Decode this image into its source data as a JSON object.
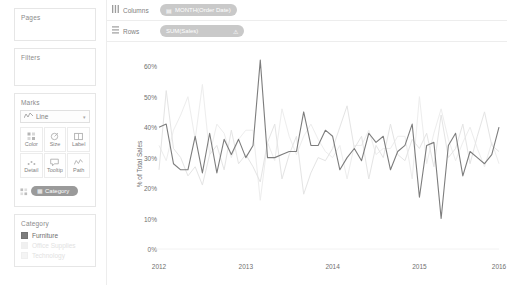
{
  "sidebar": {
    "pages": {
      "title": "Pages"
    },
    "filters": {
      "title": "Filters"
    },
    "marks": {
      "title": "Marks",
      "mark_type": "Line",
      "mark_type_caret": "▾",
      "buttons": [
        {
          "label": "Color",
          "icon": "color-icon"
        },
        {
          "label": "Size",
          "icon": "size-icon"
        },
        {
          "label": "Label",
          "icon": "label-icon"
        },
        {
          "label": "Detail",
          "icon": "detail-icon"
        },
        {
          "label": "Tooltip",
          "icon": "tooltip-icon"
        },
        {
          "label": "Path",
          "icon": "path-icon"
        }
      ],
      "color_shelf_pill": "Category"
    },
    "legend": {
      "title": "Category",
      "items": [
        {
          "label": "Furniture",
          "color": "#7d7d7d",
          "dim": false
        },
        {
          "label": "Office Supplies",
          "color": "#ececec",
          "dim": true
        },
        {
          "label": "Technology",
          "color": "#f0f0f0",
          "dim": true
        }
      ]
    }
  },
  "shelves": {
    "columns": {
      "name": "Columns",
      "pill": "MONTH(Order Date)",
      "pill_icon": "calendar-icon"
    },
    "rows": {
      "name": "Rows",
      "pill": "SUM(Sales)",
      "warning": "⚠"
    }
  },
  "chart_data": {
    "type": "line",
    "title": "",
    "xlabel": "",
    "ylabel": "% of Total Sales",
    "ylim": [
      0,
      65
    ],
    "yticks": [
      0,
      10,
      20,
      30,
      40,
      50,
      60
    ],
    "ytick_labels": [
      "0%",
      "10%",
      "20%",
      "30%",
      "40%",
      "50%",
      "60%"
    ],
    "xtick_labels": [
      "2012",
      "2013",
      "2014",
      "2015",
      "2016"
    ],
    "xtick_positions": [
      0,
      12,
      24,
      36,
      48
    ],
    "grid": false,
    "legend_position": "sidebar",
    "x": [
      0,
      1,
      2,
      3,
      4,
      5,
      6,
      7,
      8,
      9,
      10,
      11,
      12,
      13,
      14,
      15,
      16,
      17,
      18,
      19,
      20,
      21,
      22,
      23,
      24,
      25,
      26,
      27,
      28,
      29,
      30,
      31,
      32,
      33,
      34,
      35,
      36,
      37,
      38,
      39,
      40,
      41,
      42,
      43,
      44,
      45,
      46,
      47
    ],
    "series": [
      {
        "name": "Furniture",
        "color": "#7d7d7d",
        "values": [
          40,
          41,
          28,
          26,
          26,
          37,
          25,
          38,
          25,
          36,
          31,
          36,
          30,
          34,
          62,
          30,
          30,
          31,
          32,
          32,
          45,
          34,
          34,
          39,
          37,
          26,
          30,
          33,
          29,
          38,
          35,
          37,
          26,
          32,
          34,
          41,
          17,
          34,
          35,
          10,
          34,
          38,
          24,
          32,
          30,
          28,
          31,
          40
        ]
      },
      {
        "name": "Office Supplies",
        "color": "#e4e4e4",
        "values": [
          26,
          52,
          33,
          30,
          24,
          27,
          21,
          31,
          34,
          26,
          39,
          28,
          31,
          27,
          22,
          35,
          41,
          23,
          31,
          37,
          18,
          25,
          30,
          29,
          33,
          40,
          47,
          33,
          37,
          23,
          34,
          30,
          41,
          31,
          29,
          36,
          33,
          38,
          27,
          44,
          30,
          33,
          41,
          28,
          37,
          45,
          34,
          32
        ]
      },
      {
        "name": "Technology",
        "color": "#ededed",
        "values": [
          34,
          29,
          39,
          44,
          50,
          36,
          54,
          31,
          41,
          38,
          30,
          36,
          39,
          39,
          16,
          35,
          29,
          46,
          37,
          31,
          37,
          41,
          36,
          32,
          30,
          34,
          23,
          34,
          34,
          39,
          31,
          33,
          33,
          37,
          37,
          23,
          50,
          28,
          38,
          46,
          36,
          29,
          35,
          40,
          33,
          27,
          35,
          28
        ]
      }
    ]
  }
}
